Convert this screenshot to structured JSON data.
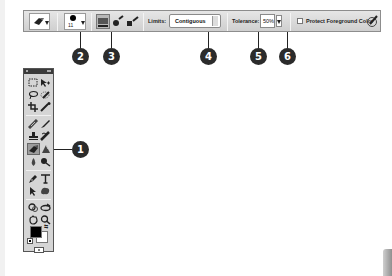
{
  "options_bar": {
    "tool_preset_icon": "background-eraser-icon",
    "brush_size": "11",
    "sampling_modes": [
      {
        "name": "sampling-continuous-icon",
        "active": true
      },
      {
        "name": "sampling-once-icon",
        "active": false
      },
      {
        "name": "sampling-background-swatch-icon",
        "active": false
      }
    ],
    "limits_label": "Limits:",
    "limits_value": "Contiguous",
    "tolerance_label": "Tolerance:",
    "tolerance_value": "50%",
    "protect_label": "Protect Foreground Color",
    "protect_checked": false,
    "tablet_pressure_icon": "tablet-pressure-icon"
  },
  "callouts": [
    {
      "number": "1",
      "target": "background-eraser-tool"
    },
    {
      "number": "2",
      "target": "brush-picker"
    },
    {
      "number": "3",
      "target": "sampling-options"
    },
    {
      "number": "4",
      "target": "limits-select"
    },
    {
      "number": "5",
      "target": "tolerance-input"
    },
    {
      "number": "6",
      "target": "protect-foreground-checkbox"
    }
  ],
  "toolbox": {
    "tools": [
      "rectangular-marquee",
      "move",
      "lasso",
      "quick-selection",
      "crop",
      "eyedropper",
      "spot-healing-brush",
      "brush",
      "clone-stamp",
      "history-brush",
      "background-eraser",
      "gradient",
      "blur",
      "dodge",
      "pen",
      "type",
      "path-selection",
      "custom-shape",
      "3d-rotate",
      "3d-orbit",
      "hand",
      "zoom"
    ],
    "active_tool": "background-eraser",
    "foreground_color": "#000000",
    "background_color": "#ffffff"
  },
  "colors": {
    "callout": "#2b2b2b",
    "bar_top": "#e6e6e6",
    "bar_bottom": "#cfcfcf"
  }
}
